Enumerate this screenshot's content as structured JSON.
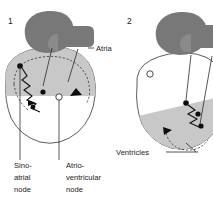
{
  "figure": {
    "kind": "heart-conduction-diagram",
    "background_color": "#ffffff",
    "panels": [
      {
        "number": "1",
        "number_x": 8,
        "number_y": 24,
        "state_description": "atria shaded / excited",
        "shaded_region": "atria",
        "sa_node_state": "filled",
        "av_node_state": "open"
      },
      {
        "number": "2",
        "number_x": 127,
        "number_y": 24,
        "state_description": "ventricles shaded / excited",
        "shaded_region": "ventricles",
        "sa_node_state": "open",
        "av_node_state": "filled"
      }
    ],
    "labels": [
      {
        "id": "atria",
        "text": "Atria",
        "x": 96,
        "y": 51
      },
      {
        "id": "ventricles",
        "text": "Ventricles",
        "x": 116,
        "y": 155
      },
      {
        "id": "sino-atrial-node",
        "lines": [
          "Sino-",
          "atrial",
          "node"
        ],
        "x": 14,
        "y": 168
      },
      {
        "id": "atrio-ventricular-node",
        "lines": [
          "Atrio-",
          "ventricular",
          "node"
        ],
        "x": 66,
        "y": 168
      }
    ],
    "colors": {
      "dark_gray": "#787878",
      "light_gray": "#c8c8c8",
      "mid_gray": "#b4b4b4",
      "white": "#ffffff",
      "outline": "#4a4a4a",
      "ink": "#111111"
    }
  }
}
